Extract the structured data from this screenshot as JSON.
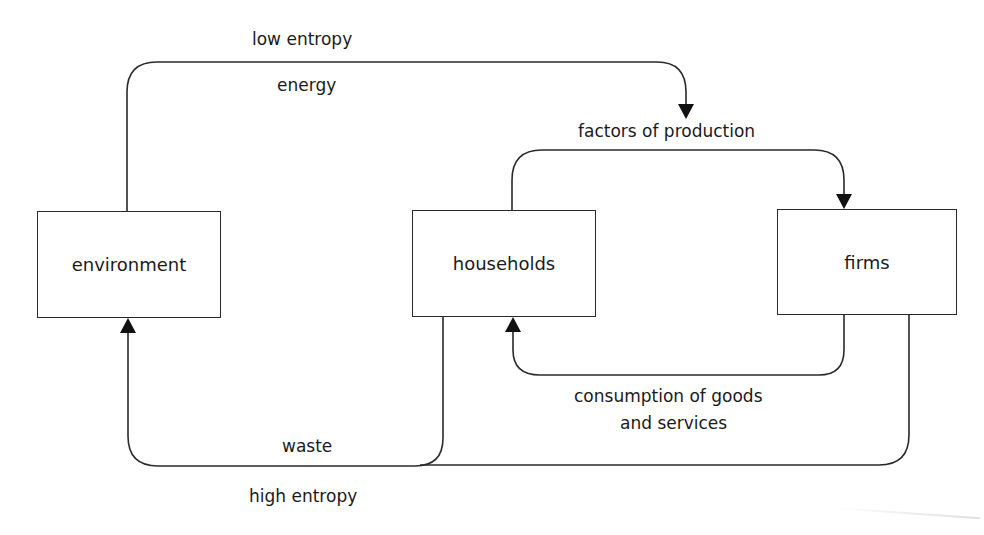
{
  "diagram": {
    "nodes": [
      {
        "id": "environment",
        "label": "environment"
      },
      {
        "id": "households",
        "label": "households"
      },
      {
        "id": "firms",
        "label": "firms"
      }
    ],
    "edges": [
      {
        "from": "environment",
        "to": "factors-of-production",
        "label_top": "low entropy",
        "label_bottom": "energy"
      },
      {
        "from": "households",
        "to": "firms",
        "label": "factors of production"
      },
      {
        "from": "firms",
        "to": "households",
        "label_line1": "consumption of goods",
        "label_line2": "and services"
      },
      {
        "from": "households+firms",
        "to": "environment",
        "label_top": "waste",
        "label_bottom": "high entropy"
      }
    ],
    "colors": {
      "line": "#2a2a2a",
      "arrow": "#111111",
      "background": "#ffffff"
    }
  }
}
